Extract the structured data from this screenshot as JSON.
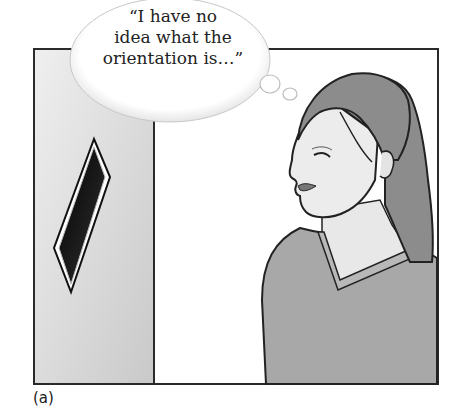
{
  "figure": {
    "caption": "(a)",
    "thought_bubble": {
      "lines": [
        "“I have no",
        "idea what the",
        "orientation is…”"
      ]
    },
    "panels": {
      "left": {
        "description": "grey wall panel with a dark diamond-shaped sign"
      },
      "right": {
        "description": "woman in profile wearing a v-neck sweater, thinking"
      }
    },
    "colors": {
      "frame": "#2a2a2a",
      "wall": "#d9d9d9",
      "hair": "#8c8c8c",
      "sweater": "#a8a8a8",
      "skin": "#e6e6e6",
      "diamond": "#111111"
    }
  }
}
